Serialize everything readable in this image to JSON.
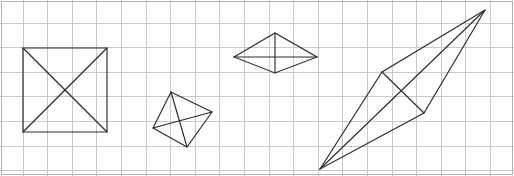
{
  "figure": {
    "width": 514,
    "height": 176,
    "background_color": "#ffffff",
    "stroke_color": "#2b2b2b",
    "stroke_width": 1.15
  },
  "grid": {
    "name": "square-grid",
    "spacing": 24.6,
    "origin_x": -2,
    "origin_y": -2,
    "line_color": "#c9c9c9",
    "frame_color": "#b0b0b0",
    "vertical_count": 22,
    "horizontal_count": 8,
    "show_frame": true
  },
  "shapes": [
    {
      "id": "shape-1",
      "name": "axis-aligned-square",
      "label": "Square",
      "vertices": [
        [
          23,
          48
        ],
        [
          107,
          48
        ],
        [
          107,
          132
        ],
        [
          23,
          132
        ]
      ],
      "diagonals": [
        [
          [
            23,
            48
          ],
          [
            107,
            132
          ]
        ],
        [
          [
            107,
            48
          ],
          [
            23,
            132
          ]
        ]
      ],
      "center": [
        65,
        90
      ],
      "side_length": 84
    },
    {
      "id": "shape-2",
      "name": "tilted-quadrilateral",
      "label": "Tilted quadrilateral",
      "vertices": [
        [
          171,
          92
        ],
        [
          212,
          112
        ],
        [
          187,
          147
        ],
        [
          153,
          128
        ]
      ],
      "diagonals": [
        [
          [
            171,
            92
          ],
          [
            187,
            147
          ]
        ],
        [
          [
            212,
            112
          ],
          [
            153,
            128
          ]
        ]
      ],
      "center": [
        181,
        120
      ]
    },
    {
      "id": "shape-3",
      "name": "flat-rhombus",
      "label": "Flat rhombus",
      "vertices": [
        [
          234,
          57
        ],
        [
          275,
          33
        ],
        [
          317,
          57
        ],
        [
          275,
          73
        ]
      ],
      "diagonals": [
        [
          [
            234,
            57
          ],
          [
            317,
            57
          ]
        ],
        [
          [
            275,
            33
          ],
          [
            275,
            73
          ]
        ]
      ],
      "center": [
        275,
        55
      ],
      "horizontal_diagonal": 83,
      "vertical_diagonal": 40
    },
    {
      "id": "shape-4",
      "name": "elongated-rhombus",
      "label": "Elongated rhombus",
      "vertices": [
        [
          320,
          169
        ],
        [
          382,
          72
        ],
        [
          485,
          10
        ],
        [
          424,
          113
        ]
      ],
      "diagonals": [
        [
          [
            320,
            169
          ],
          [
            485,
            10
          ]
        ],
        [
          [
            382,
            72
          ],
          [
            424,
            113
          ]
        ]
      ],
      "center": [
        402,
        92
      ],
      "long_diagonal": 229,
      "short_diagonal": 59
    }
  ]
}
